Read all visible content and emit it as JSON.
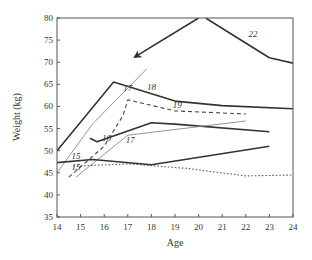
{
  "chart_data": {
    "type": "line",
    "title": "",
    "xlabel": "Age",
    "ylabel": "Weight (kg)",
    "xlim": [
      14,
      24
    ],
    "ylim": [
      35,
      80
    ],
    "xticks": [
      14,
      15,
      16,
      17,
      18,
      19,
      20,
      21,
      22,
      23,
      24
    ],
    "yticks": [
      35,
      40,
      45,
      50,
      55,
      60,
      65,
      70,
      75,
      80
    ],
    "grid": false,
    "legend": "none",
    "series": [
      {
        "name": "line-thick-top",
        "style": "solid-thick",
        "color": "#333333",
        "points": [
          [
            14,
            50
          ],
          [
            16.4,
            65.5
          ],
          [
            19,
            61.2
          ],
          [
            21,
            60.2
          ],
          [
            24,
            59.5
          ]
        ]
      },
      {
        "name": "line-22",
        "style": "solid-thick",
        "color": "#333333",
        "points": [
          [
            20.3,
            80
          ],
          [
            21.5,
            76
          ],
          [
            23,
            71
          ],
          [
            24,
            69.8
          ]
        ]
      },
      {
        "name": "arrow",
        "style": "solid-thick-arrow",
        "color": "#333333",
        "points": [
          [
            20,
            80
          ],
          [
            17.3,
            71.2
          ]
        ]
      },
      {
        "name": "line-thin-17-upper",
        "style": "solid-thin",
        "color": "#888888",
        "points": [
          [
            14,
            45
          ],
          [
            15.5,
            56
          ],
          [
            17.8,
            68.5
          ]
        ]
      },
      {
        "name": "line-dashed-19",
        "style": "dashed",
        "color": "#444444",
        "points": [
          [
            14.5,
            44
          ],
          [
            16,
            51
          ],
          [
            16.8,
            58
          ],
          [
            17,
            61.5
          ],
          [
            19,
            59
          ],
          [
            22,
            58.3
          ]
        ]
      },
      {
        "name": "line-16",
        "style": "solid-thick",
        "color": "#333333",
        "points": [
          [
            15.4,
            52.8
          ],
          [
            15.7,
            52
          ],
          [
            18,
            56.3
          ],
          [
            19,
            56
          ],
          [
            23,
            54.3
          ]
        ]
      },
      {
        "name": "line-thin-17-lower",
        "style": "solid-thin",
        "color": "#888888",
        "points": [
          [
            14.8,
            44
          ],
          [
            17,
            53.5
          ],
          [
            22,
            56.7
          ]
        ]
      },
      {
        "name": "line-15",
        "style": "solid-thick",
        "color": "#333333",
        "points": [
          [
            14,
            47.3
          ],
          [
            15.5,
            48
          ],
          [
            18,
            46.8
          ],
          [
            23,
            51
          ]
        ]
      },
      {
        "name": "line-dotted",
        "style": "dotted",
        "color": "#555555",
        "points": [
          [
            14.7,
            46.5
          ],
          [
            17,
            47
          ],
          [
            19.5,
            46
          ],
          [
            22,
            44.3
          ],
          [
            24,
            44.5
          ]
        ]
      }
    ],
    "annotations": [
      {
        "text": "22",
        "x": 22.3,
        "y": 75.6
      },
      {
        "text": "17",
        "x": 17,
        "y": 63.5
      },
      {
        "text": "18",
        "x": 18,
        "y": 63.8
      },
      {
        "text": "19",
        "x": 19.1,
        "y": 59.6
      },
      {
        "text": "16",
        "x": 16.1,
        "y": 52.2
      },
      {
        "text": "17",
        "x": 17.1,
        "y": 51.8
      },
      {
        "text": "15",
        "x": 14.8,
        "y": 48.2
      },
      {
        "text": "15",
        "x": 14.8,
        "y": 45.6
      }
    ]
  }
}
